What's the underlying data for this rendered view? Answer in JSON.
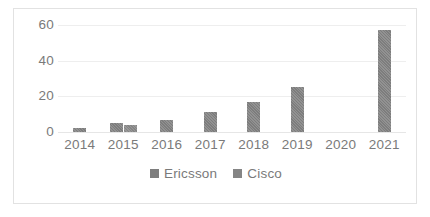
{
  "chart_data": {
    "type": "bar",
    "title": "",
    "subtitle": "",
    "xlabel": "",
    "ylabel": "",
    "categories": [
      "2014",
      "2015",
      "2016",
      "2017",
      "2018",
      "2019",
      "2020",
      "2021"
    ],
    "series": [
      {
        "name": "Ericsson",
        "color": "#7d7d7d",
        "values": [
          2,
          5,
          7,
          11,
          17,
          25,
          null,
          57
        ]
      },
      {
        "name": "Cisco",
        "color": "#858585",
        "values": [
          null,
          4,
          null,
          null,
          null,
          null,
          null,
          null
        ]
      }
    ],
    "ylim": [
      0,
      60
    ],
    "yticks": [
      0,
      20,
      40,
      60
    ],
    "ytick_labels": [
      "0",
      "20",
      "40",
      "60"
    ],
    "grid": true,
    "legend_position": "bottom",
    "legend_entries": [
      "Ericsson",
      "Cisco"
    ],
    "plot_background": "#ffffff",
    "border_color": "#e2e2e2",
    "gridline_color": "#eeeeee",
    "tick_label_color": "#7a7a7a"
  }
}
